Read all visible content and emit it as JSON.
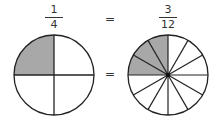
{
  "left_fraction": {
    "numerator": "1",
    "denominator": "4"
  },
  "right_fraction": {
    "numerator": "3",
    "denominator": "12"
  },
  "equals_top": "=",
  "equals_middle": "=",
  "left_circle": {
    "parts": 4,
    "shaded": 1
  },
  "right_circle": {
    "parts": 12,
    "shaded": 3
  },
  "colors": {
    "shade": "#a8a8a8",
    "stroke": "#222222",
    "fill": "#ffffff"
  }
}
